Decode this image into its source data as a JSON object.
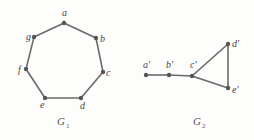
{
  "graphs": [
    {
      "name": "G1",
      "label": "G",
      "subscript": "1",
      "label_pos": [
        57,
        125
      ],
      "vertices": [
        {
          "id": "a",
          "label": "a",
          "x": 64,
          "y": 23,
          "lx": 62,
          "ly": 16
        },
        {
          "id": "b",
          "label": "b",
          "x": 96,
          "y": 38,
          "lx": 100,
          "ly": 42
        },
        {
          "id": "c",
          "label": "c",
          "x": 103,
          "y": 72,
          "lx": 106,
          "ly": 76
        },
        {
          "id": "d",
          "label": "d",
          "x": 81,
          "y": 98,
          "lx": 80,
          "ly": 109
        },
        {
          "id": "e",
          "label": "e",
          "x": 45,
          "y": 98,
          "lx": 40,
          "ly": 108
        },
        {
          "id": "f",
          "label": "f",
          "x": 26,
          "y": 69,
          "lx": 18,
          "ly": 73
        },
        {
          "id": "g",
          "label": "g",
          "x": 34,
          "y": 37,
          "lx": 26,
          "ly": 40
        }
      ],
      "edges": [
        [
          "a",
          "b"
        ],
        [
          "b",
          "c"
        ],
        [
          "c",
          "d"
        ],
        [
          "d",
          "e"
        ],
        [
          "e",
          "f"
        ],
        [
          "f",
          "g"
        ],
        [
          "g",
          "a"
        ]
      ]
    },
    {
      "name": "G2",
      "label": "G",
      "subscript": "2",
      "label_pos": [
        193,
        125
      ],
      "vertices": [
        {
          "id": "a'",
          "label": "a'",
          "x": 146,
          "y": 75,
          "lx": 143,
          "ly": 68
        },
        {
          "id": "b'",
          "label": "b'",
          "x": 169,
          "y": 75,
          "lx": 166,
          "ly": 68
        },
        {
          "id": "c'",
          "label": "c'",
          "x": 192,
          "y": 76,
          "lx": 190,
          "ly": 68
        },
        {
          "id": "d'",
          "label": "d'",
          "x": 228,
          "y": 44,
          "lx": 232,
          "ly": 47
        },
        {
          "id": "e'",
          "label": "e'",
          "x": 228,
          "y": 88,
          "lx": 232,
          "ly": 93
        }
      ],
      "edges": [
        [
          "a'",
          "b'"
        ],
        [
          "b'",
          "c'"
        ],
        [
          "c'",
          "d'"
        ],
        [
          "d'",
          "e'"
        ],
        [
          "e'",
          "c'"
        ]
      ]
    }
  ],
  "colors": {
    "background": "#fdfdfb",
    "edge": "#6a6a6a",
    "vertex": "#555555",
    "label": "#444444"
  }
}
